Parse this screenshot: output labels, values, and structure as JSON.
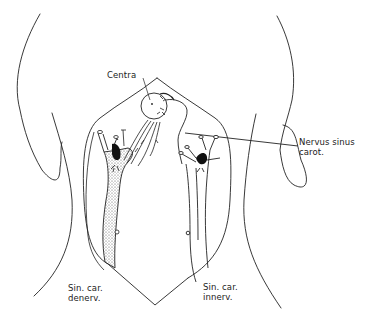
{
  "figure": {
    "stroke_color": "#222222",
    "fill_dark": "#111111",
    "fill_stipple": "#bdbdbd",
    "background": "#ffffff"
  },
  "labels": {
    "centra": "Centra",
    "nervus_line1": "Nervus sinus",
    "nervus_line2": "carot.",
    "denerv_line1": "Sin. car.",
    "denerv_line2": "denerv.",
    "innerv_line1": "Sin. car.",
    "innerv_line2": "innerv."
  }
}
